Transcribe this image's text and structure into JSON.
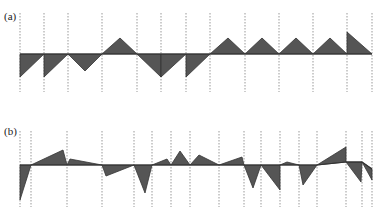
{
  "panels": [
    {
      "label": "(a)",
      "baseline_y": 54,
      "grid_top": 13,
      "grid_bottom": 92,
      "x_start": 20,
      "x_end": 372,
      "gridlines_x": [
        20,
        44,
        68,
        102,
        137,
        161,
        186,
        210,
        245,
        279,
        313,
        347,
        372
      ],
      "triangles": [
        [
          [
            20,
            54
          ],
          [
            20,
            77
          ],
          [
            44,
            54
          ]
        ],
        [
          [
            44,
            54
          ],
          [
            44,
            77
          ],
          [
            68,
            54
          ]
        ],
        [
          [
            68,
            54
          ],
          [
            85,
            71
          ],
          [
            102,
            54
          ]
        ],
        [
          [
            102,
            54
          ],
          [
            120,
            38
          ],
          [
            137,
            54
          ]
        ],
        [
          [
            137,
            54
          ],
          [
            161,
            77
          ],
          [
            161,
            54
          ]
        ],
        [
          [
            161,
            54
          ],
          [
            161,
            77
          ],
          [
            186,
            54
          ]
        ],
        [
          [
            186,
            54
          ],
          [
            186,
            77
          ],
          [
            210,
            54
          ]
        ],
        [
          [
            210,
            54
          ],
          [
            228,
            38
          ],
          [
            245,
            54
          ]
        ],
        [
          [
            245,
            54
          ],
          [
            262,
            38
          ],
          [
            279,
            54
          ]
        ],
        [
          [
            279,
            54
          ],
          [
            296,
            38
          ],
          [
            313,
            54
          ]
        ],
        [
          [
            313,
            54
          ],
          [
            330,
            38
          ],
          [
            347,
            54
          ]
        ],
        [
          [
            347,
            54
          ],
          [
            347,
            32
          ],
          [
            372,
            54
          ]
        ]
      ]
    },
    {
      "label": "(b)",
      "baseline_y": 165,
      "grid_top": 131,
      "grid_bottom": 207,
      "x_start": 20,
      "x_end": 372,
      "gridlines_x": [
        20,
        31,
        67,
        102,
        134,
        152,
        171,
        190,
        219,
        244,
        261,
        280,
        299,
        317,
        346,
        362,
        372
      ],
      "triangles": [
        [
          [
            20,
            165
          ],
          [
            20,
            200
          ],
          [
            31,
            165
          ]
        ],
        [
          [
            31,
            165
          ],
          [
            63,
            150
          ],
          [
            67,
            165
          ]
        ],
        [
          [
            67,
            165
          ],
          [
            70,
            159
          ],
          [
            102,
            165
          ]
        ],
        [
          [
            102,
            165
          ],
          [
            106,
            176
          ],
          [
            134,
            165
          ]
        ],
        [
          [
            134,
            165
          ],
          [
            145,
            193
          ],
          [
            152,
            165
          ]
        ],
        [
          [
            152,
            165
          ],
          [
            167,
            159
          ],
          [
            171,
            165
          ]
        ],
        [
          [
            171,
            165
          ],
          [
            180,
            151
          ],
          [
            190,
            165
          ]
        ],
        [
          [
            190,
            165
          ],
          [
            199,
            155
          ],
          [
            219,
            165
          ]
        ],
        [
          [
            219,
            165
          ],
          [
            242,
            157
          ],
          [
            244,
            165
          ]
        ],
        [
          [
            244,
            165
          ],
          [
            253,
            188
          ],
          [
            261,
            165
          ]
        ],
        [
          [
            261,
            165
          ],
          [
            280,
            165
          ],
          [
            280,
            190
          ]
        ],
        [
          [
            280,
            165
          ],
          [
            287,
            162
          ],
          [
            299,
            165
          ]
        ],
        [
          [
            299,
            165
          ],
          [
            303,
            185
          ],
          [
            317,
            165
          ]
        ],
        [
          [
            317,
            165
          ],
          [
            346,
            147
          ],
          [
            346,
            162
          ]
        ],
        [
          [
            346,
            162
          ],
          [
            362,
            162
          ],
          [
            361,
            182
          ]
        ],
        [
          [
            362,
            162
          ],
          [
            372,
            169
          ],
          [
            372,
            180
          ]
        ]
      ],
      "baseline_segments": [
        [
          [
            20,
            165
          ],
          [
            317,
            165
          ]
        ],
        [
          [
            317,
            165
          ],
          [
            346,
            162
          ]
        ],
        [
          [
            346,
            162
          ],
          [
            362,
            162
          ]
        ],
        [
          [
            362,
            162
          ],
          [
            372,
            169
          ]
        ]
      ]
    }
  ]
}
